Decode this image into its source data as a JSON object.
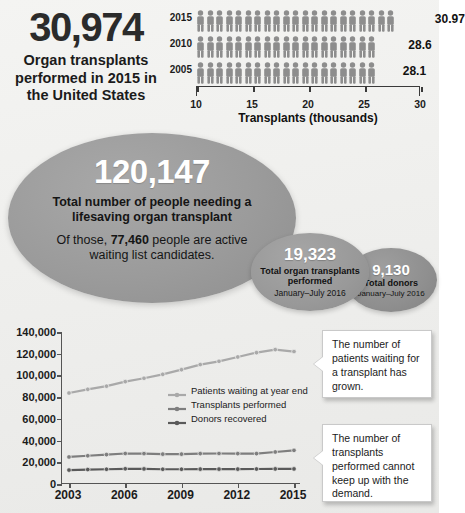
{
  "headline": {
    "number": "30,974",
    "caption": "Organ transplants performed in 2015 in the United States"
  },
  "pictogram_chart": {
    "axis_title": "Transplants (thousands)",
    "axis_min": 10,
    "axis_max": 30,
    "tick_labels": [
      "10",
      "15",
      "20",
      "25",
      "30"
    ],
    "icon": "person-icon",
    "icon_color": "#8d8d8d",
    "rows": [
      {
        "year": "2015",
        "value": "30.97",
        "value_num": 30.97,
        "icons": 21
      },
      {
        "year": "2010",
        "value": "28.6",
        "value_num": 28.6,
        "icons": 19
      },
      {
        "year": "2005",
        "value": "28.1",
        "value_num": 28.1,
        "icons": 19
      }
    ]
  },
  "main_ellipse": {
    "number": "120,147",
    "subtitle": "Total number of people needing a lifesaving organ transplant",
    "note_prefix": "Of those, ",
    "note_value": "77,460",
    "note_suffix": " people are active waiting list candidates."
  },
  "transplants_ellipse": {
    "number": "19,323",
    "label": "Total organ transplants performed",
    "period": "January–July 2016"
  },
  "donors_ellipse": {
    "number": "9,130",
    "label": "Total donors",
    "period": "January–July 2016"
  },
  "callouts": {
    "waiting": "The number of patients waiting for a transplant has grown.",
    "demand": "The number of transplants performed cannot keep up with the demand."
  },
  "colors": {
    "ellipse_gray": "#9a9a9a",
    "ellipse_small_gray": "#999999",
    "ellipse_smallest_gray": "#8f8f8f",
    "series_light": "#a9a9a9",
    "series_mid": "#7e7e7e",
    "series_dark": "#5a5a5a",
    "axis": "#555555",
    "text_dark": "#1b1b1b",
    "callout_bg": "#ffffff"
  },
  "chart_data": {
    "type": "line",
    "title": "",
    "xlabel": "",
    "ylabel": "",
    "grid": false,
    "legend_position": "inside-right",
    "x": [
      2003,
      2004,
      2005,
      2006,
      2007,
      2008,
      2009,
      2010,
      2011,
      2012,
      2013,
      2014,
      2015
    ],
    "tick_labels_x": [
      "2003",
      "2006",
      "2009",
      "2012",
      "2015"
    ],
    "tick_labels_y": [
      "0",
      "20,000",
      "40,000",
      "60,000",
      "80,000",
      "100,000",
      "120,000",
      "140,000"
    ],
    "ylim": [
      0,
      140000
    ],
    "ytick_step": 20000,
    "series": [
      {
        "name": "Patients waiting at year end",
        "color": "#a9a9a9",
        "values": [
          83800,
          87200,
          90100,
          94300,
          97400,
          101000,
          105300,
          110000,
          113000,
          117000,
          121000,
          123800,
          122000
        ]
      },
      {
        "name": "Transplants performed",
        "color": "#7e7e7e",
        "values": [
          24900,
          26000,
          27100,
          28100,
          28000,
          27500,
          27500,
          28000,
          28100,
          28000,
          28000,
          29500,
          30974
        ]
      },
      {
        "name": "Donors recovered",
        "color": "#5a5a5a",
        "values": [
          12800,
          13300,
          13600,
          14000,
          13900,
          13600,
          13600,
          13700,
          13700,
          13700,
          13800,
          13900,
          13900
        ]
      }
    ]
  }
}
